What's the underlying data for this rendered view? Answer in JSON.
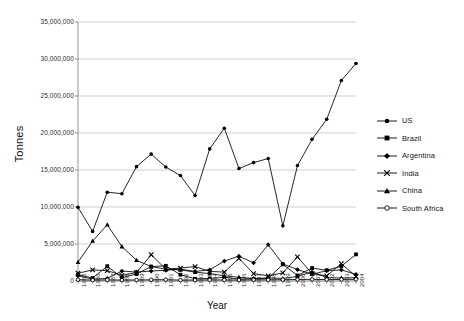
{
  "chart_data": {
    "type": "line",
    "title": "",
    "xlabel": "Year",
    "ylabel": "Tonnes",
    "grid": true,
    "legend_position": "right",
    "ylim": [
      0,
      35000000
    ],
    "ytick_labels": [
      "35,000,000",
      "30,000,000",
      "25,000,000",
      "20,000,000",
      "15,000,000",
      "10,000,000",
      "5,000,000",
      "0"
    ],
    "ytick_values": [
      35000000,
      30000000,
      25000000,
      20000000,
      15000000,
      10000000,
      5000000,
      0
    ],
    "categories": [
      "1985",
      "1986",
      "1987",
      "1988",
      "1989",
      "1990",
      "1991",
      "1992",
      "1993",
      "1994",
      "1995",
      "1996",
      "1997",
      "1998",
      "1999",
      "2000",
      "2001",
      "2002",
      "2003",
      "2004"
    ],
    "series": [
      {
        "name": "US",
        "marker": "filled-circle",
        "color": "#000000",
        "values": [
          9950000,
          6700000,
          12000000,
          11800000,
          15450000,
          17150000,
          15400000,
          14250000,
          11550000,
          17850000,
          20650000,
          15200000,
          16000000,
          16550000,
          7450000,
          15600000,
          19150000,
          21850000,
          27100000,
          29400000
        ]
      },
      {
        "name": "Brazil",
        "marker": "filled-square",
        "color": "#000000",
        "values": [
          850000,
          400000,
          2000000,
          450000,
          950000,
          1950000,
          2050000,
          850000,
          300000,
          350000,
          500000,
          250000,
          300000,
          350000,
          2250000,
          750000,
          1750000,
          1450000,
          2000000,
          3600000
        ]
      },
      {
        "name": "Argentina",
        "marker": "filled-diamond",
        "color": "#000000",
        "values": [
          700000,
          250000,
          350000,
          1350000,
          1200000,
          1350000,
          1450000,
          1600000,
          1300000,
          1500000,
          2700000,
          3350000,
          2450000,
          4900000,
          2300000,
          1550000,
          900000,
          1400000,
          1500000,
          900000
        ]
      },
      {
        "name": "India",
        "marker": "cross-x",
        "color": "#000000",
        "values": [
          1050000,
          1500000,
          1400000,
          750000,
          1150000,
          3550000,
          1600000,
          1750000,
          1950000,
          1300000,
          1200000,
          3050000,
          1000000,
          700000,
          1100000,
          3250000,
          1000000,
          700000,
          2350000,
          600000
        ]
      },
      {
        "name": "China",
        "marker": "filled-triangle",
        "color": "#000000",
        "values": [
          2550000,
          5400000,
          7600000,
          4650000,
          2800000,
          1950000,
          1600000,
          1500000,
          1200000,
          1000000,
          700000,
          500000,
          350000,
          400000,
          350000,
          600000,
          1250000,
          450000,
          400000,
          450000
        ]
      },
      {
        "name": "South Africa",
        "marker": "open-circle",
        "color": "#000000",
        "values": [
          180000,
          120000,
          150000,
          130000,
          140000,
          160000,
          180000,
          120000,
          130000,
          150000,
          140000,
          130000,
          160000,
          150000,
          180000,
          200000,
          220000,
          190000,
          210000,
          230000
        ]
      }
    ]
  },
  "legend": {
    "items": [
      {
        "label": "US"
      },
      {
        "label": "Brazil"
      },
      {
        "label": "Argentina"
      },
      {
        "label": "India"
      },
      {
        "label": "China"
      },
      {
        "label": "South Africa"
      }
    ]
  }
}
